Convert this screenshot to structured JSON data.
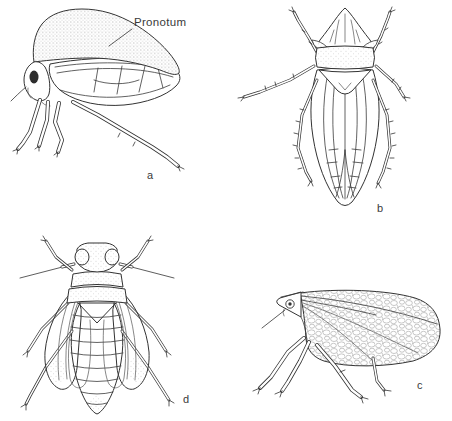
{
  "figure": {
    "background_color": "#ffffff",
    "line_color": "#333333",
    "pronotum_annotation": "Pronotum",
    "panel_labels": {
      "a": "a",
      "b": "b",
      "c": "c",
      "d": "d"
    }
  }
}
